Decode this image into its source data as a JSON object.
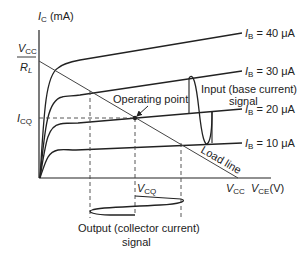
{
  "axes": {
    "y_label_main": "I",
    "y_label_sub": "C",
    "y_label_unit": " (mA)",
    "x_label_main": "V",
    "x_label_sub": "CE",
    "x_label_unit": "(V)"
  },
  "y_ticks": {
    "vcc_num_main": "V",
    "vcc_num_sub": "CC",
    "rl_den_main": "R",
    "rl_den_sub": "L",
    "icq_main": "I",
    "icq_sub": "CQ"
  },
  "x_ticks": {
    "vcc_main": "V",
    "vcc_sub": "CC",
    "vcq_main": "V",
    "vcq_sub": "CQ"
  },
  "curves": [
    {
      "name": "I",
      "sub": "B",
      "value": " = 40 μA"
    },
    {
      "name": "I",
      "sub": "B",
      "value": " = 30 μA"
    },
    {
      "name": "I",
      "sub": "B",
      "value": " = 20 μA"
    },
    {
      "name": "I",
      "sub": "B",
      "value": " = 10 μA"
    }
  ],
  "annotations": {
    "operating_point": "Operating point",
    "load_line": "Load line",
    "input_line1": "Input (base current)",
    "input_line2": "signal",
    "output_line1": "Output (collector current)",
    "output_line2": "signal"
  }
}
